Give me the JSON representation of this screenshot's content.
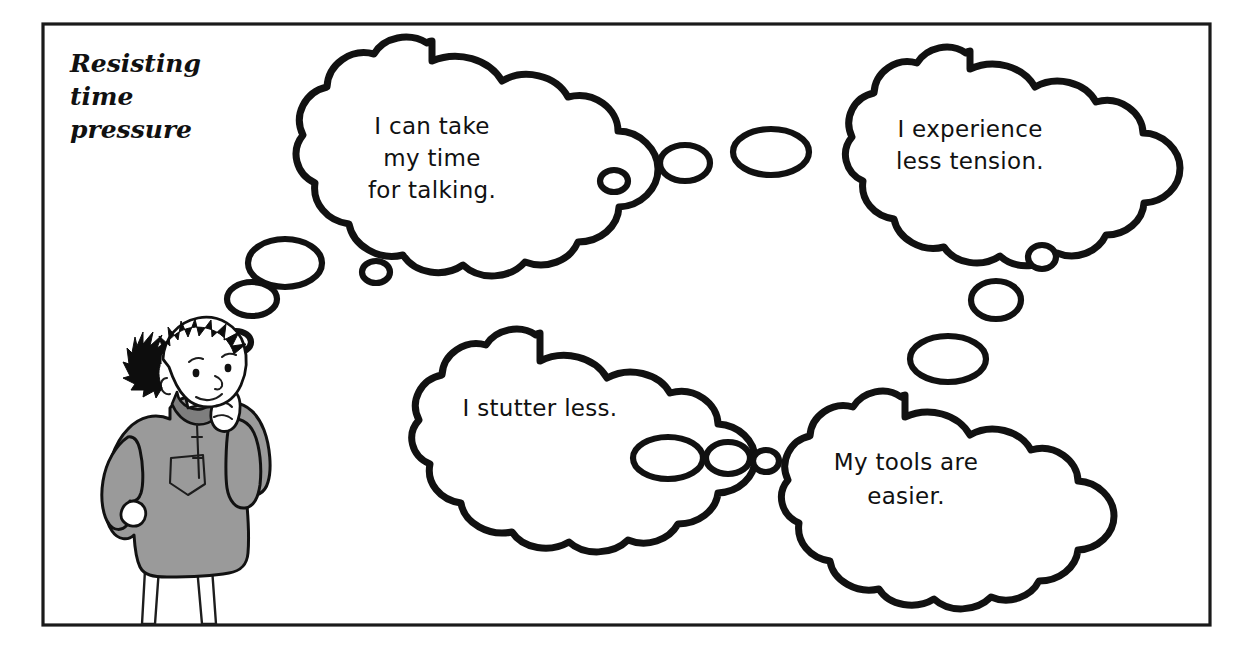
{
  "panel": {
    "title_lines": [
      "Resisting",
      "time",
      "pressure"
    ],
    "title_full": "Resisting time pressure",
    "border_color": "#1a1a1a",
    "background_color": "#ffffff"
  },
  "character": {
    "name": "thinking-boy",
    "description": "Boy with spiky black hair, hand to chin, looking up, wearing gray sweater with chest pocket",
    "garment_color": "#9a9a9a",
    "hair_color": "#0d0d0d",
    "ink_color": "#111111"
  },
  "bubbles": [
    {
      "id": "bubble-take-my-time",
      "lines": [
        "I can take",
        "my time",
        "for talking."
      ],
      "text": "I can take my time for talking."
    },
    {
      "id": "bubble-less-tension",
      "lines": [
        "I experience",
        "less tension."
      ],
      "text": "I experience less tension."
    },
    {
      "id": "bubble-stutter-less",
      "lines": [
        "I stutter less."
      ],
      "text": "I stutter less."
    },
    {
      "id": "bubble-tools-easier",
      "lines": [
        "My tools are",
        "easier."
      ],
      "text": "My tools are easier."
    }
  ],
  "trails": [
    {
      "id": "trail-character-to-bubble-1",
      "count": 3
    },
    {
      "id": "trail-bubble-1-to-bubble-2",
      "count": 3
    },
    {
      "id": "trail-bubble-2-to-bubble-4",
      "count": 3
    },
    {
      "id": "trail-bubble-3-to-bubble-4",
      "count": 3
    }
  ]
}
